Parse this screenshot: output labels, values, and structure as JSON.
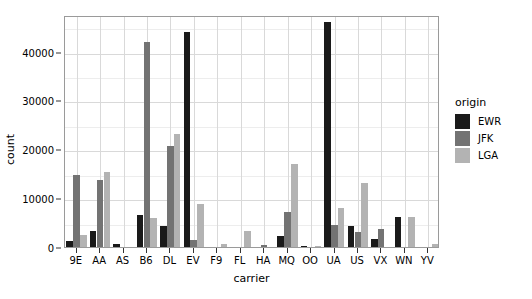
{
  "chart_data": {
    "type": "bar",
    "title": "",
    "subtitle": "",
    "xlabel": "carrier",
    "ylabel": "count",
    "categories": [
      "9E",
      "AA",
      "AS",
      "B6",
      "DL",
      "EV",
      "F9",
      "FL",
      "HA",
      "MQ",
      "OO",
      "UA",
      "US",
      "VX",
      "WN",
      "YV"
    ],
    "series": [
      {
        "name": "EWR",
        "color": "#1a1a1a",
        "values": [
          1268,
          3363,
          714,
          6557,
          4342,
          43939,
          0,
          0,
          0,
          2276,
          6,
          46087,
          4405,
          1566,
          6188,
          0
        ]
      },
      {
        "name": "JFK",
        "color": "#737373",
        "values": [
          14651,
          13783,
          0,
          42076,
          20701,
          1408,
          0,
          0,
          342,
          7193,
          0,
          4534,
          2995,
          3596,
          0,
          0
        ]
      },
      {
        "name": "LGA",
        "color": "#b3b3b3",
        "values": [
          2541,
          15459,
          0,
          6002,
          23067,
          8826,
          685,
          3260,
          0,
          16928,
          26,
          8044,
          13136,
          0,
          6087,
          601
        ]
      }
    ],
    "ylim": [
      0,
      47500
    ],
    "yticks": [
      0,
      10000,
      20000,
      30000,
      40000
    ],
    "ytick_labels": [
      "0",
      "10000",
      "20000",
      "30000",
      "40000"
    ],
    "yminor_ticks": [
      5000,
      15000,
      25000,
      35000,
      45000
    ],
    "grid": true,
    "legend_position": "right",
    "legend_title": "origin",
    "panel_background": "#ffffff",
    "gridline_color": "#d9d9d9",
    "panel_border_color": "#9a9a9a"
  }
}
